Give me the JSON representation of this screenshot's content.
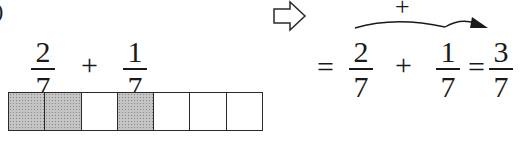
{
  "left": {
    "fraction_a": {
      "numerator": "2",
      "denominator": "7"
    },
    "operator": "+",
    "fraction_b": {
      "numerator": "1",
      "denominator": "7"
    },
    "bar_model": {
      "total_cells": 7,
      "shaded_cells": [
        1,
        2,
        4
      ],
      "shade_color": "#c4c4c4"
    }
  },
  "arrow": {
    "icon": "hollow-right-arrow"
  },
  "right": {
    "equals_1": "=",
    "fraction_a": {
      "numerator": "2",
      "denominator": "7"
    },
    "operator": "+",
    "fraction_b": {
      "numerator": "1",
      "denominator": "7"
    },
    "equals_2": "=",
    "result": {
      "numerator": "3",
      "denominator": "7"
    },
    "arc_label": "+"
  },
  "corner_mark": ")"
}
